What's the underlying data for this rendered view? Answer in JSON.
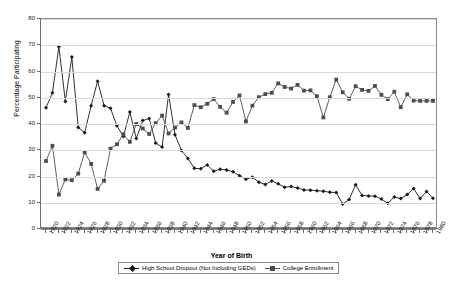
{
  "chart_data": {
    "type": "line",
    "title": "",
    "xlabel": "Year of Birth",
    "ylabel": "Percentage Participating",
    "xlim": [
      1920,
      1980
    ],
    "ylim": [
      0,
      80
    ],
    "ytick_step": 10,
    "yticks": [
      0,
      10,
      20,
      30,
      40,
      50,
      60,
      70,
      80
    ],
    "xtick_labels": [
      1920,
      1922,
      1924,
      1926,
      1928,
      1930,
      1932,
      1934,
      1936,
      1938,
      1940,
      1942,
      1944,
      1946,
      1948,
      1950,
      1952,
      1954,
      1956,
      1958,
      1960,
      1962,
      1964,
      1966,
      1968,
      1970,
      1972,
      1974,
      1976,
      1978,
      1980
    ],
    "xtick_label_step": 2,
    "grid": true,
    "legend_position": "bottom",
    "x": [
      1920,
      1921,
      1922,
      1923,
      1924,
      1925,
      1926,
      1927,
      1928,
      1929,
      1930,
      1931,
      1932,
      1933,
      1934,
      1935,
      1936,
      1937,
      1938,
      1939,
      1940,
      1941,
      1942,
      1943,
      1944,
      1945,
      1946,
      1947,
      1948,
      1949,
      1950,
      1951,
      1952,
      1953,
      1954,
      1955,
      1956,
      1957,
      1958,
      1959,
      1960,
      1961,
      1962,
      1963,
      1964,
      1965,
      1966,
      1967,
      1968,
      1969,
      1970,
      1971,
      1972,
      1973,
      1974,
      1975,
      1976,
      1977,
      1978,
      1979,
      1980
    ],
    "series": [
      {
        "name": "High School Dropout (Not Including GEDs)",
        "marker": "diamond",
        "color": "#1a1a1a",
        "values": [
          46.2,
          51.9,
          69.5,
          48.6,
          65.5,
          38.7,
          36.7,
          47.0,
          56.3,
          47.0,
          46.0,
          39.3,
          35.2,
          44.6,
          34.5,
          41.3,
          42.1,
          32.8,
          31.2,
          51.2,
          35.9,
          29.9,
          26.9,
          23.1,
          23.0,
          24.4,
          22.0,
          22.8,
          22.5,
          21.8,
          20.3,
          19.0,
          19.7,
          17.8,
          17.0,
          18.3,
          17.2,
          15.9,
          16.2,
          15.6,
          14.9,
          14.8,
          14.6,
          14.4,
          14.0,
          13.9,
          9.5,
          11.2,
          16.9,
          12.8,
          12.6,
          12.5,
          11.4,
          9.8,
          12.2,
          11.6,
          13.1,
          15.4,
          11.6,
          14.3,
          11.7
        ]
      },
      {
        "name": "College Enrollment",
        "marker": "square",
        "color": "#4d4d4d",
        "values": [
          25.9,
          31.7,
          13.1,
          18.9,
          18.6,
          21.1,
          29.2,
          24.8,
          15.3,
          18.4,
          30.6,
          32.3,
          36.1,
          33.2,
          40.0,
          38.3,
          36.2,
          40.3,
          43.2,
          36.4,
          38.6,
          40.6,
          38.5,
          47.2,
          46.4,
          47.7,
          49.5,
          46.5,
          44.3,
          48.4,
          50.9,
          41.0,
          47.0,
          50.2,
          51.4,
          51.9,
          55.5,
          54.1,
          53.5,
          54.9,
          52.7,
          52.8,
          50.6,
          42.5,
          50.2,
          56.9,
          52.1,
          49.6,
          54.4,
          53.0,
          52.6,
          54.5,
          51.1,
          49.5,
          52.3,
          46.4,
          51.3,
          48.9,
          48.8,
          48.8,
          48.8
        ]
      }
    ]
  }
}
